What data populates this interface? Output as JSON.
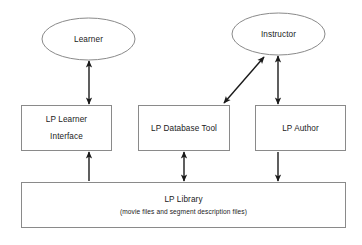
{
  "diagram": {
    "background_color": "#ffffff",
    "shape_stroke_color": "#8a8a8a",
    "connector_color": "#1a1a1a",
    "text_color": "#1a1a1a",
    "actors": [
      {
        "id": "learner",
        "label": "Learner",
        "shape": "ellipse",
        "cx": 88.5,
        "cy": 39,
        "rx": 46.5,
        "ry": 21
      },
      {
        "id": "instructor",
        "label": "Instructor",
        "shape": "ellipse",
        "cx": 278.5,
        "cy": 34,
        "rx": 46.5,
        "ry": 21
      }
    ],
    "components": [
      {
        "id": "lp-learner-interface",
        "label_line1": "LP Learner",
        "label_line2": "Interface",
        "shape": "rect",
        "x": 21,
        "y": 105,
        "width": 91,
        "height": 46
      },
      {
        "id": "lp-database-tool",
        "label_line1": "LP Database Tool",
        "label_line2": "",
        "shape": "rect",
        "x": 138,
        "y": 105,
        "width": 92,
        "height": 46
      },
      {
        "id": "lp-author",
        "label_line1": "LP Author",
        "label_line2": "",
        "shape": "rect",
        "x": 255,
        "y": 105,
        "width": 91,
        "height": 46
      }
    ],
    "repository": {
      "id": "lp-library",
      "label_line1": "LP Library",
      "label_line2": "(movie files and segment description files)",
      "shape": "rect",
      "x": 21,
      "y": 182,
      "width": 325,
      "height": 46
    },
    "connectors": [
      {
        "id": "learner-to-interface",
        "from": "learner",
        "to": "lp-learner-interface",
        "direction": "bidirectional",
        "x1": 89,
        "y1": 60,
        "x2": 89,
        "y2": 105
      },
      {
        "id": "instructor-to-database-tool",
        "from": "instructor",
        "to": "lp-database-tool",
        "direction": "bidirectional",
        "x1": 265,
        "y1": 56,
        "x2": 223,
        "y2": 104
      },
      {
        "id": "instructor-to-author",
        "from": "instructor",
        "to": "lp-author",
        "direction": "bidirectional",
        "x1": 278,
        "y1": 55,
        "x2": 278,
        "y2": 105
      },
      {
        "id": "library-to-interface",
        "from": "lp-library",
        "to": "lp-learner-interface",
        "direction": "up",
        "x1": 89,
        "y1": 182,
        "x2": 89,
        "y2": 151
      },
      {
        "id": "database-tool-to-library",
        "from": "lp-database-tool",
        "to": "lp-library",
        "direction": "bidirectional",
        "x1": 184,
        "y1": 151,
        "x2": 184,
        "y2": 182
      },
      {
        "id": "author-to-library",
        "from": "lp-author",
        "to": "lp-library",
        "direction": "down",
        "x1": 278,
        "y1": 151,
        "x2": 278,
        "y2": 182
      }
    ]
  }
}
